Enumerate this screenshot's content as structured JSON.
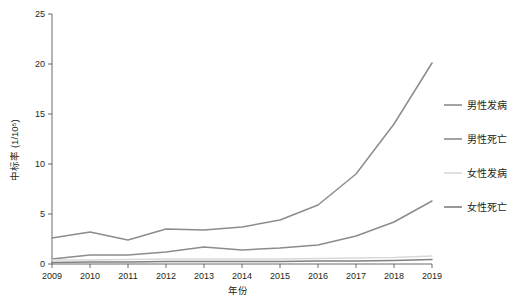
{
  "chart_data": {
    "type": "line",
    "title": "",
    "xlabel": "年份",
    "ylabel": "中标率 (1/10⁵)",
    "categories": [
      "2009",
      "2010",
      "2011",
      "2012",
      "2013",
      "2014",
      "2015",
      "2016",
      "2017",
      "2018",
      "2019"
    ],
    "x": [
      2009,
      2010,
      2011,
      2012,
      2013,
      2014,
      2015,
      2016,
      2017,
      2018,
      2019
    ],
    "xlim": [
      2009,
      2019
    ],
    "ylim": [
      0,
      25
    ],
    "yticks": [
      0,
      5,
      10,
      15,
      20,
      25
    ],
    "grid": false,
    "legend_position": "right",
    "series": [
      {
        "name": "男性发病",
        "color": "#8c8c8c",
        "values": [
          2.6,
          3.2,
          2.4,
          3.5,
          3.4,
          3.7,
          4.4,
          5.9,
          9.0,
          14.0,
          20.1
        ]
      },
      {
        "name": "男性死亡",
        "color": "#8c8c8c",
        "values": [
          0.5,
          0.9,
          0.9,
          1.2,
          1.7,
          1.4,
          1.6,
          1.9,
          2.8,
          4.2,
          6.3
        ]
      },
      {
        "name": "女性发病",
        "color": "#d9d9d9",
        "values": [
          0.4,
          0.4,
          0.45,
          0.5,
          0.5,
          0.5,
          0.5,
          0.55,
          0.6,
          0.65,
          0.8
        ]
      },
      {
        "name": "女性死亡",
        "color": "#808080",
        "values": [
          0.15,
          0.2,
          0.2,
          0.25,
          0.25,
          0.25,
          0.25,
          0.3,
          0.3,
          0.35,
          0.45
        ]
      }
    ]
  },
  "axes": {
    "y_tick_labels": [
      "0",
      "5",
      "10",
      "15",
      "20",
      "25"
    ],
    "x_tick_labels": [
      "2009",
      "2010",
      "2011",
      "2012",
      "2013",
      "2014",
      "2015",
      "2016",
      "2017",
      "2018",
      "2019"
    ],
    "x_axis_title": "年份",
    "y_axis_title": "中标率 (1/10⁵)"
  },
  "legend": {
    "items": [
      {
        "label": "男性发病",
        "color": "#8c8c8c"
      },
      {
        "label": "男性死亡",
        "color": "#8c8c8c"
      },
      {
        "label": "女性发病",
        "color": "#d9d9d9"
      },
      {
        "label": "女性死亡",
        "color": "#808080"
      }
    ]
  }
}
